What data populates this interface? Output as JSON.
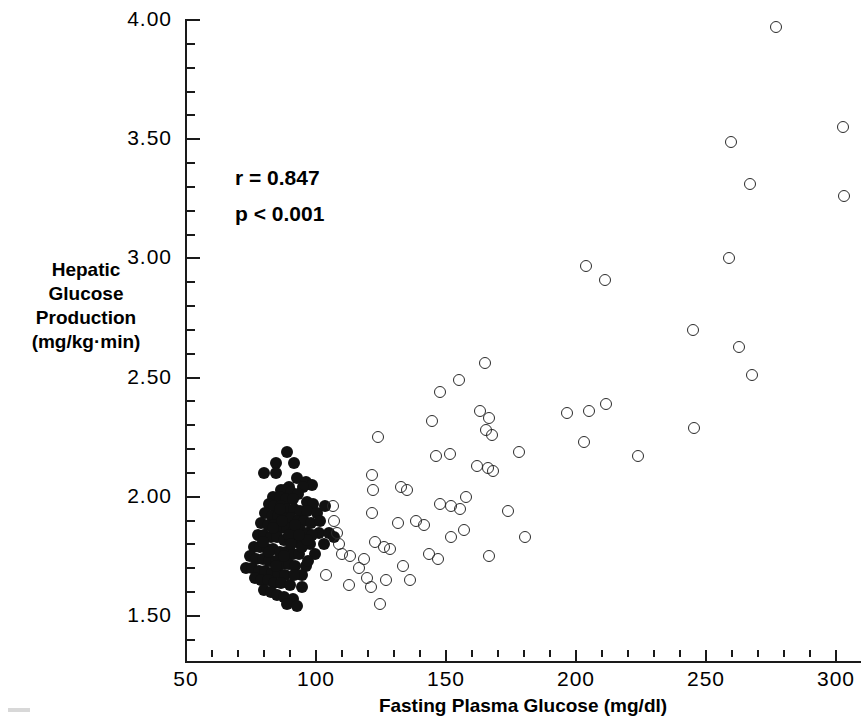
{
  "axes": {
    "x_title": "Fasting Plasma Glucose (mg/dl)",
    "y_title_lines": [
      "Hepatic",
      "Glucose",
      "Production",
      "(mg/kg·min)"
    ],
    "x_ticklabels": [
      "50",
      "100",
      "150",
      "200",
      "250",
      "300"
    ],
    "y_ticklabels": [
      "4.00",
      "3.50",
      "3.00",
      "2.50",
      "2.00",
      "1.50"
    ]
  },
  "annotations": {
    "correlation": "r = 0.847",
    "pvalue": "p < 0.001"
  },
  "chart_data": {
    "type": "scatter",
    "title": "",
    "xlabel": "Fasting Plasma Glucose (mg/dl)",
    "ylabel": "Hepatic Glucose Production (mg/kg·min)",
    "xlim": [
      50,
      310
    ],
    "ylim": [
      1.31,
      4.05
    ],
    "xticks": [
      50,
      100,
      150,
      200,
      250,
      300
    ],
    "yticks": [
      4.0,
      3.5,
      3.0,
      2.5,
      2.0,
      1.5
    ],
    "x_minor_step": 10,
    "y_minor_step": 0.1,
    "grid": false,
    "legend": false,
    "stats": {
      "r": 0.847,
      "p_text": "< 0.001"
    },
    "series": [
      {
        "name": "Normal subjects (filled circles)",
        "marker": "filled-circle",
        "color": "#111111",
        "points": [
          [
            88.7,
            2.19
          ],
          [
            84.5,
            2.14
          ],
          [
            91.5,
            2.14
          ],
          [
            80.1,
            2.1
          ],
          [
            84.5,
            2.1
          ],
          [
            92.6,
            2.08
          ],
          [
            96.0,
            2.06
          ],
          [
            98.5,
            2.05
          ],
          [
            95.0,
            2.04
          ],
          [
            89.5,
            2.04
          ],
          [
            86.5,
            2.03
          ],
          [
            88.0,
            2.03
          ],
          [
            90.5,
            2.02
          ],
          [
            93.0,
            2.01
          ],
          [
            83.5,
            2.0
          ],
          [
            86.0,
            2.0
          ],
          [
            88.5,
            1.99
          ],
          [
            91.0,
            1.99
          ],
          [
            96.5,
            1.98
          ],
          [
            99.0,
            1.97
          ],
          [
            82.0,
            1.97
          ],
          [
            84.0,
            1.96
          ],
          [
            86.5,
            1.96
          ],
          [
            89.0,
            1.95
          ],
          [
            91.5,
            1.95
          ],
          [
            94.0,
            1.94
          ],
          [
            96.5,
            1.94
          ],
          [
            100.5,
            1.93
          ],
          [
            80.5,
            1.93
          ],
          [
            83.0,
            1.92
          ],
          [
            85.5,
            1.92
          ],
          [
            88.0,
            1.91
          ],
          [
            90.5,
            1.91
          ],
          [
            93.0,
            1.9
          ],
          [
            95.5,
            1.9
          ],
          [
            98.0,
            1.89
          ],
          [
            79.0,
            1.89
          ],
          [
            81.5,
            1.88
          ],
          [
            84.0,
            1.88
          ],
          [
            86.5,
            1.87
          ],
          [
            89.0,
            1.87
          ],
          [
            91.5,
            1.86
          ],
          [
            94.0,
            1.86
          ],
          [
            96.5,
            1.85
          ],
          [
            101.0,
            1.85
          ],
          [
            77.5,
            1.84
          ],
          [
            80.0,
            1.84
          ],
          [
            82.5,
            1.83
          ],
          [
            85.0,
            1.83
          ],
          [
            87.5,
            1.82
          ],
          [
            90.0,
            1.82
          ],
          [
            92.5,
            1.81
          ],
          [
            95.0,
            1.81
          ],
          [
            97.5,
            1.8
          ],
          [
            103.0,
            1.8
          ],
          [
            76.0,
            1.79
          ],
          [
            78.5,
            1.79
          ],
          [
            81.0,
            1.78
          ],
          [
            83.5,
            1.78
          ],
          [
            86.0,
            1.77
          ],
          [
            88.5,
            1.77
          ],
          [
            91.0,
            1.76
          ],
          [
            93.5,
            1.76
          ],
          [
            99.5,
            1.76
          ],
          [
            74.5,
            1.75
          ],
          [
            77.0,
            1.74
          ],
          [
            79.5,
            1.74
          ],
          [
            82.0,
            1.73
          ],
          [
            84.5,
            1.73
          ],
          [
            87.0,
            1.72
          ],
          [
            89.5,
            1.72
          ],
          [
            92.0,
            1.71
          ],
          [
            96.0,
            1.71
          ],
          [
            73.0,
            1.7
          ],
          [
            75.5,
            1.7
          ],
          [
            78.0,
            1.69
          ],
          [
            80.5,
            1.69
          ],
          [
            83.0,
            1.68
          ],
          [
            85.5,
            1.68
          ],
          [
            88.0,
            1.67
          ],
          [
            94.5,
            1.67
          ],
          [
            76.5,
            1.66
          ],
          [
            79.0,
            1.65
          ],
          [
            81.5,
            1.65
          ],
          [
            84.0,
            1.64
          ],
          [
            86.5,
            1.64
          ],
          [
            90.0,
            1.63
          ],
          [
            80.0,
            1.61
          ],
          [
            82.5,
            1.6
          ],
          [
            85.0,
            1.59
          ],
          [
            87.5,
            1.58
          ],
          [
            91.0,
            1.57
          ],
          [
            89.0,
            1.55
          ],
          [
            92.5,
            1.54
          ],
          [
            94.5,
            1.62
          ],
          [
            97.0,
            1.73
          ],
          [
            98.5,
            1.84
          ],
          [
            101.5,
            1.9
          ],
          [
            103.5,
            1.96
          ],
          [
            87.0,
            1.9
          ],
          [
            89.5,
            1.84
          ],
          [
            92.0,
            1.88
          ],
          [
            94.5,
            1.79
          ],
          [
            96.5,
            1.82
          ],
          [
            86.0,
            1.95
          ],
          [
            83.5,
            1.87
          ],
          [
            90.5,
            1.8
          ],
          [
            93.5,
            1.84
          ],
          [
            79.5,
            1.81
          ],
          [
            82.0,
            1.77
          ],
          [
            105.0,
            1.85
          ],
          [
            107.0,
            1.83
          ],
          [
            84.5,
            1.71
          ],
          [
            87.5,
            1.75
          ],
          [
            91.5,
            1.67
          ]
        ]
      },
      {
        "name": "Diabetic subjects (open circles)",
        "marker": "open-circle",
        "color": "#2b2b2b",
        "points": [
          [
            277.0,
            3.97
          ],
          [
            302.5,
            3.55
          ],
          [
            259.5,
            3.49
          ],
          [
            267.0,
            3.31
          ],
          [
            303.0,
            3.26
          ],
          [
            259.0,
            3.0
          ],
          [
            204.0,
            2.97
          ],
          [
            211.0,
            2.91
          ],
          [
            245.0,
            2.7
          ],
          [
            262.5,
            2.63
          ],
          [
            267.5,
            2.51
          ],
          [
            165.0,
            2.56
          ],
          [
            155.0,
            2.49
          ],
          [
            147.5,
            2.44
          ],
          [
            211.5,
            2.39
          ],
          [
            205.0,
            2.36
          ],
          [
            196.5,
            2.35
          ],
          [
            163.0,
            2.36
          ],
          [
            166.5,
            2.33
          ],
          [
            245.5,
            2.29
          ],
          [
            144.5,
            2.32
          ],
          [
            203.0,
            2.23
          ],
          [
            165.5,
            2.28
          ],
          [
            167.5,
            2.26
          ],
          [
            124.0,
            2.25
          ],
          [
            178.0,
            2.19
          ],
          [
            151.5,
            2.18
          ],
          [
            146.0,
            2.17
          ],
          [
            224.0,
            2.17
          ],
          [
            162.0,
            2.13
          ],
          [
            166.0,
            2.12
          ],
          [
            168.0,
            2.11
          ],
          [
            121.5,
            2.09
          ],
          [
            122.0,
            2.03
          ],
          [
            132.5,
            2.04
          ],
          [
            135.0,
            2.03
          ],
          [
            157.5,
            2.0
          ],
          [
            147.5,
            1.97
          ],
          [
            152.0,
            1.96
          ],
          [
            155.5,
            1.95
          ],
          [
            174.0,
            1.94
          ],
          [
            121.5,
            1.93
          ],
          [
            131.5,
            1.89
          ],
          [
            138.5,
            1.9
          ],
          [
            141.5,
            1.88
          ],
          [
            106.5,
            1.96
          ],
          [
            107.0,
            1.9
          ],
          [
            108.0,
            1.85
          ],
          [
            109.0,
            1.8
          ],
          [
            110.0,
            1.76
          ],
          [
            122.5,
            1.81
          ],
          [
            126.0,
            1.79
          ],
          [
            128.5,
            1.78
          ],
          [
            113.0,
            1.75
          ],
          [
            118.5,
            1.74
          ],
          [
            143.5,
            1.76
          ],
          [
            147.0,
            1.74
          ],
          [
            180.5,
            1.83
          ],
          [
            166.5,
            1.75
          ],
          [
            104.0,
            1.67
          ],
          [
            119.5,
            1.66
          ],
          [
            127.0,
            1.65
          ],
          [
            136.0,
            1.65
          ],
          [
            112.5,
            1.63
          ],
          [
            121.0,
            1.62
          ],
          [
            124.5,
            1.55
          ],
          [
            116.5,
            1.7
          ],
          [
            133.5,
            1.71
          ],
          [
            152.0,
            1.83
          ],
          [
            157.0,
            1.86
          ]
        ]
      }
    ]
  }
}
